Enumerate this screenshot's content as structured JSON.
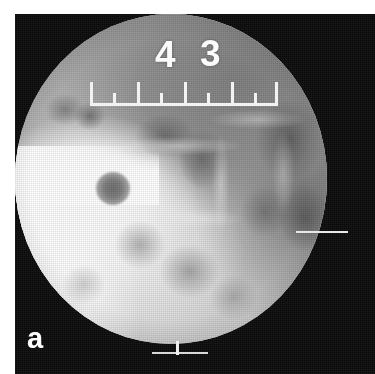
{
  "figure": {
    "panel_label": "a",
    "modality": "radiograph",
    "field_shape": "circular",
    "background_color": "#090909",
    "field_color": "#b9b9b9"
  },
  "scale_ruler": {
    "name": "centimeter-scale-ruler",
    "orientation": "horizontal",
    "numbers": [
      {
        "label": "4",
        "left_px": 155,
        "top_px": 36
      },
      {
        "label": "3",
        "left_px": 200,
        "top_px": 35
      }
    ],
    "ticks": [
      {
        "type": "major",
        "left_px": 0
      },
      {
        "type": "minor",
        "left_px": 23
      },
      {
        "type": "major",
        "left_px": 47
      },
      {
        "type": "minor",
        "left_px": 70
      },
      {
        "type": "major",
        "left_px": 94
      },
      {
        "type": "minor",
        "left_px": 117
      },
      {
        "type": "major",
        "left_px": 141
      },
      {
        "type": "minor",
        "left_px": 164
      },
      {
        "type": "major",
        "left_px": 185
      }
    ]
  },
  "markers": {
    "right_line": "right-edge-marker-line",
    "bottom_tick": "bottom-edge-marker-tick",
    "bottom_bar": "bottom-edge-marker-bar"
  },
  "colors": {
    "plate": "#090909",
    "ruler": "#f2f2f2",
    "numerals": "#fbfbfb",
    "panel_letter": "#ffffff",
    "nodule": "#6c6c6c",
    "bright_region": "#ffffff"
  }
}
